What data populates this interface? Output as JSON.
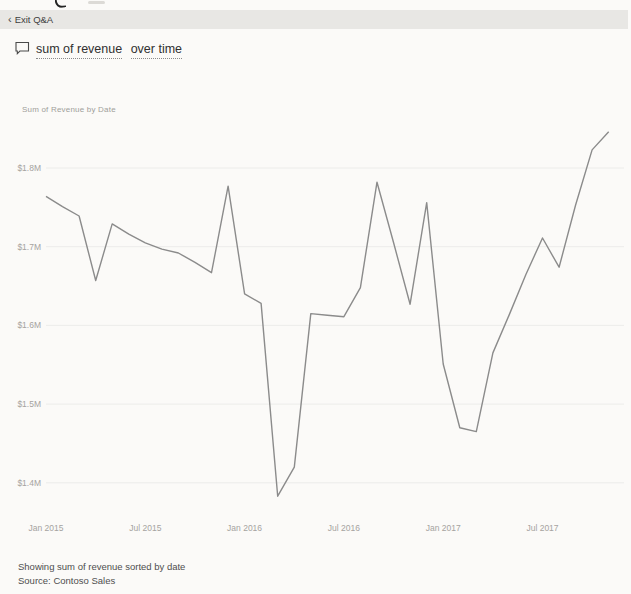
{
  "exit_bar": {
    "back_chevron": "‹",
    "label": "Exit Q&A"
  },
  "question": {
    "segments": [
      "sum of revenue",
      "over time"
    ]
  },
  "status": {
    "line1": "Showing sum of revenue sorted by date",
    "line2": "Source: Contoso Sales"
  },
  "colors": {
    "background": "#fbfaf8",
    "toolbar_bg": "#e8e7e4",
    "line": "#8b8b8b",
    "gridline": "#ececea",
    "axis_text": "#a5a3a0",
    "question_text": "#303030",
    "status_text": "#4e4e4e"
  },
  "chart_data": {
    "type": "line",
    "title": "Sum of Revenue by Date",
    "y_unit": "USD millions",
    "grid": "horizontal",
    "legend": "none",
    "line_color": "#8b8b8b",
    "ylim": [
      1.36,
      1.86
    ],
    "x": [
      "Jan 2015",
      "Feb 2015",
      "Mar 2015",
      "Apr 2015",
      "May 2015",
      "Jun 2015",
      "Jul 2015",
      "Aug 2015",
      "Sep 2015",
      "Oct 2015",
      "Nov 2015",
      "Dec 2015",
      "Jan 2016",
      "Feb 2016",
      "Mar 2016",
      "Apr 2016",
      "May 2016",
      "Jun 2016",
      "Jul 2016",
      "Aug 2016",
      "Sep 2016",
      "Oct 2016",
      "Nov 2016",
      "Dec 2016",
      "Jan 2017",
      "Feb 2017",
      "Mar 2017",
      "Apr 2017",
      "May 2017",
      "Jun 2017",
      "Jul 2017",
      "Aug 2017",
      "Sep 2017",
      "Oct 2017",
      "Nov 2017"
    ],
    "values": [
      1.764,
      1.751,
      1.739,
      1.657,
      1.729,
      1.716,
      1.705,
      1.697,
      1.692,
      1.68,
      1.667,
      1.777,
      1.64,
      1.628,
      1.383,
      1.42,
      1.615,
      1.613,
      1.611,
      1.648,
      1.782,
      1.705,
      1.627,
      1.756,
      1.551,
      1.47,
      1.465,
      1.565,
      1.614,
      1.665,
      1.711,
      1.674,
      1.753,
      1.823,
      1.846
    ],
    "y_ticks": {
      "labels": [
        "$1.8M",
        "$1.7M",
        "$1.6M",
        "$1.5M",
        "$1.4M"
      ],
      "values": [
        1.8,
        1.7,
        1.6,
        1.5,
        1.4
      ]
    },
    "x_ticks": {
      "labels": [
        "Jan 2015",
        "Jul 2015",
        "Jan 2016",
        "Jul 2016",
        "Jan 2017",
        "Jul 2017"
      ],
      "indices": [
        0,
        6,
        12,
        18,
        24,
        30
      ]
    }
  }
}
